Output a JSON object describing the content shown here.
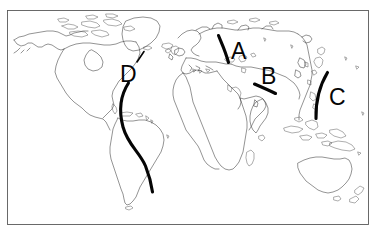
{
  "figure": {
    "type": "world-map-diagram",
    "title": "",
    "background_color": "#ffffff",
    "frame_color": "#5a5a5a",
    "coastline_color": "#3a3a3a",
    "marker_color": "#050505",
    "width": 376,
    "height": 236
  },
  "markers": [
    {
      "id": "A",
      "label": "A",
      "label_x": 231,
      "label_y": 59,
      "region": "northern-eurasia-arctic-coast",
      "leader_shape": "short-curved-arc",
      "leader_path": "M 218.5 35.5 C 221.5 43 225.5 51 228.5 62.5"
    },
    {
      "id": "B",
      "label": "B",
      "label_x": 261,
      "label_y": 84,
      "region": "central-asia",
      "leader_shape": "short-diagonal-stroke",
      "leader_path": "M 254.5 84.0 C 261.5 87.0 268.5 90.0 275.5 93.5"
    },
    {
      "id": "C",
      "label": "C",
      "label_x": 329,
      "label_y": 105,
      "region": "east-asia-pacific-coast",
      "leader_shape": "long-vertical-arc",
      "leader_path": "M 327.5 72.5 C 320.0 85.0 315.5 99.0 316.0 118.5"
    },
    {
      "id": "D",
      "label": "D",
      "label_x": 120,
      "label_y": 82,
      "region": "mid-atlantic-ocean",
      "leader_shape": "long-s-curve",
      "leader_path": "M 128.5 83.0 C 120.0 96.0 118.5 110.0 123.0 127.0 C 128.0 145.0 139.5 152.0 145.5 166.0 C 149.5 176.0 151.5 185.0 152.5 192.0",
      "tick_path": "M 144.0 51.5 L 137.0 62.0"
    }
  ],
  "geography": {
    "landmasses": [
      "North America",
      "Greenland",
      "South America",
      "Europe",
      "Africa",
      "Asia",
      "Australia",
      "New Zealand",
      "Indonesia",
      "Japan",
      "Madagascar",
      "Iceland",
      "British Isles"
    ],
    "projection": "equirectangular"
  }
}
